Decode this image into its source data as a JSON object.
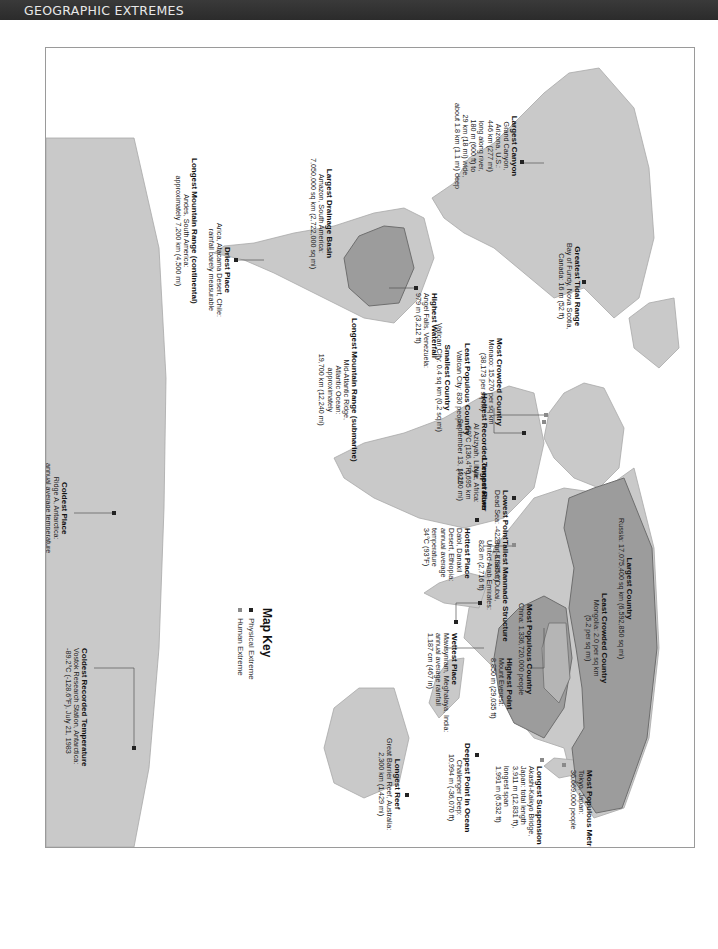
{
  "header": {
    "title": "GEOGRAPHIC EXTREMES"
  },
  "map_key": {
    "title": "Map Key",
    "items": [
      {
        "label": "Physical Extreme",
        "color": "#222222"
      },
      {
        "label": "Human Extreme",
        "color": "#8a8a8a"
      }
    ]
  },
  "colors": {
    "land": "#c9c9c9",
    "highlight": "#9c9c9c",
    "ocean": "#ffffff",
    "border": "#7a7a7a"
  },
  "labels": {
    "largest_canyon": {
      "title": "Largest Canyon",
      "lines": [
        "Grand Canyon,",
        "Arizona, U.S.:",
        "446 km (277 mi)",
        "long along river,",
        "180 m (600 ft) to",
        "29 km (18 mi) wide,",
        "about 1.8 km (1.1 mi) deep"
      ]
    },
    "greatest_tidal_range": {
      "title": "Greatest Tidal Range",
      "lines": [
        "Bay of Fundy, Nova Scotia,",
        "Canada: 16 m (52 ft)"
      ]
    },
    "largest_drainage_basin": {
      "title": "Largest Drainage Basin",
      "lines": [
        "Amazon, South America:",
        "7,050,000 sq km (2,722,000 sq mi)"
      ]
    },
    "driest_place": {
      "title": "Driest Place",
      "lines": [
        "Arica, Atacama Desert, Chile:",
        "rainfall barely measurable"
      ]
    },
    "longest_mountain_range_continental": {
      "title": "Longest Mountain Range (continental)",
      "lines": [
        "Andes, South America:",
        "approximately 7,200 km (4,500 mi)"
      ]
    },
    "highest_waterfall": {
      "title": "Highest Waterfall",
      "lines": [
        "Angel Falls, Venezuela:",
        "979 m (3,212 ft)"
      ]
    },
    "longest_mountain_range_submarine": {
      "title": "Longest Mountain Range (submarine)",
      "lines": [
        "Mid-Atlantic Ridge,",
        "Atlantic Ocean:",
        "approximately",
        "19,700 km (12,240 mi)"
      ]
    },
    "most_crowded_country": {
      "title": "Most Crowded Country",
      "lines": [
        "Monaco: 15,270 per sq km",
        "(38,173 per sq mi)"
      ]
    },
    "least_populous_country": {
      "title": "Least Populous Country",
      "lines": [
        "Vatican City: 830 people"
      ]
    },
    "smallest_country": {
      "title": "Smallest Country",
      "lines": [
        "Vatican City: 0.4 sq km (0.2 sq mi)"
      ]
    },
    "hottest_recorded_temperature": {
      "title": "Hottest Recorded Temperature",
      "lines": [
        "Al Azizyah, Libya:",
        "58°C (136.4°F),",
        "September 13, 1922"
      ]
    },
    "longest_river": {
      "title": "Longest River",
      "lines": [
        "Nile, Africa:",
        "6,695 km",
        "(4,160 mi)"
      ]
    },
    "lowest_point": {
      "title": "Lowest Point",
      "lines": [
        "Dead Sea: -422 m (-1,385 ft)"
      ]
    },
    "tallest_manmade_structure": {
      "title": "Tallest Manmade Structure",
      "lines": [
        "Burj Khalifa, Dubai,",
        "United Arab Emirates:",
        "828 m (2,716 ft)"
      ]
    },
    "hottest_place": {
      "title": "Hottest Place",
      "lines": [
        "Dalol, Danakil",
        "Desert, Ethiopia:",
        "annual average",
        "temperature",
        "34°C (93°F)"
      ]
    },
    "largest_country": {
      "title": "Largest Country",
      "lines": [
        "Russia: 17,075,400 sq km (6,592,850 sq mi)"
      ]
    },
    "least_crowded_country": {
      "title": "Least Crowded Country",
      "lines": [
        "Mongolia: 2.0 per sq km",
        "(5.2 per sq mi)"
      ]
    },
    "most_populous_country": {
      "title": "Most Populous Country",
      "lines": [
        "China: 1,336,720,000 people"
      ]
    },
    "highest_point": {
      "title": "Highest Point",
      "lines": [
        "Mount Everest:",
        "8,850 m (29,035 ft)"
      ]
    },
    "wettest_place": {
      "title": "Wettest Place",
      "lines": [
        "Mawsynram, Meghalaya, India:",
        "annual average rainfall",
        "1,187 cm (467 in)"
      ]
    },
    "most_populous_metro": {
      "title": "Most Populous Metropolitan Area",
      "lines": [
        "Tokyo, Japan:",
        "36,669,000 people"
      ]
    },
    "longest_suspension_bridge": {
      "title": "Longest Suspension Bridge",
      "lines": [
        "Akashi-Kaikyo Bridge,",
        "Japan: total length",
        "3,911 m (12,831 ft),",
        "longest span",
        "1,991 m (6,532 ft)"
      ]
    },
    "deepest_point": {
      "title": "Deepest Point in Ocean",
      "lines": [
        "Challenger Deep:",
        "10,994 m (-36,070 ft)"
      ]
    },
    "longest_reef": {
      "title": "Longest Reef",
      "lines": [
        "Great Barrier Reef, Australia:",
        "2,300 km (1,429 mi)"
      ]
    },
    "coldest_place": {
      "title": "Coldest Place",
      "lines": [
        "Ridge A, Antarctica:",
        "annual average temperature",
        "-74°C (-94°F)"
      ]
    },
    "coldest_recorded_temperature": {
      "title": "Coldest Recorded Temperature",
      "lines": [
        "Vostok Research Station, Antarctica:",
        "-89.2°C (-128.6°F), July 21, 1983"
      ]
    }
  }
}
